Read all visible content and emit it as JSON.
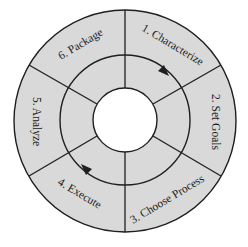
{
  "diagram": {
    "type": "cycle-wheel",
    "colors": {
      "ring_fill": "#d9d9d9",
      "line": "#1f1f1f",
      "center_fill": "#ffffff",
      "background": "#ffffff"
    },
    "steps": [
      {
        "id": 1,
        "label": "1. Characterize"
      },
      {
        "id": 2,
        "label": "2. Set Goals"
      },
      {
        "id": 3,
        "label": "3. Choose Process"
      },
      {
        "id": 4,
        "label": "4. Execute"
      },
      {
        "id": 5,
        "label": "5. Analyze"
      },
      {
        "id": 6,
        "label": "6. Package"
      }
    ],
    "cycle_direction": "clockwise"
  }
}
